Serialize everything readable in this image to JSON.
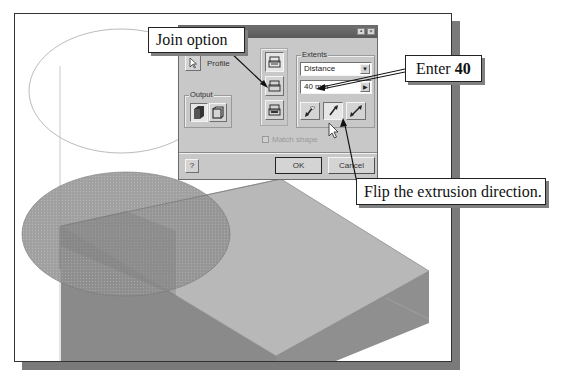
{
  "callouts": {
    "join_option": "Join option",
    "enter_prefix": "Enter ",
    "enter_value": "40",
    "flip_direction": "Flip the extrusion direction."
  },
  "dialog": {
    "title": "",
    "title_buttons": [
      "▪",
      "×"
    ],
    "profile_label": "Profile",
    "output_label": "Output",
    "operation_buttons": [
      {
        "name": "join",
        "selected": true
      },
      {
        "name": "cut",
        "selected": false
      },
      {
        "name": "intersect",
        "selected": false
      }
    ],
    "extents": {
      "group_label": "Extents",
      "type_value": "Distance",
      "distance_value": "40 mm",
      "direction_buttons": [
        {
          "name": "direction-1",
          "selected": false
        },
        {
          "name": "direction-2",
          "selected": true
        },
        {
          "name": "symmetric",
          "selected": false
        }
      ]
    },
    "match_shape_label": "Match shape",
    "help_label": "?",
    "ok_label": "OK",
    "cancel_label": "Cancel"
  },
  "colors": {
    "frame_shadow": "#7a7a7a",
    "dialog_bg": "#c8c8c8",
    "block_top": "#b5b5b5",
    "block_side": "#8a8a8a",
    "profile_fill": "#8f8f8f"
  }
}
